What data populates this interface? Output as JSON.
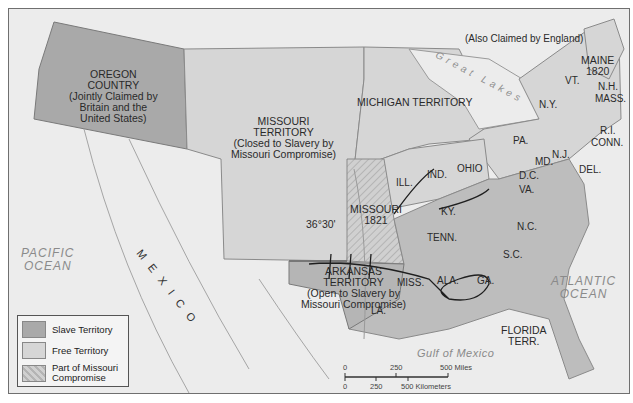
{
  "map": {
    "territories": {
      "oregon": {
        "name": "OREGON",
        "name2": "COUNTRY",
        "note1": "(Jointly Claimed by",
        "note2": "Britain and the",
        "note3": "United States)"
      },
      "missouri_territory": {
        "name": "MISSOURI",
        "name2": "TERRITORY",
        "note1": "(Closed to Slavery by",
        "note2": "Missouri Compromise)"
      },
      "michigan": {
        "name": "MICHIGAN TERRITORY"
      },
      "arkansas": {
        "name": "ARKANSAS",
        "name2": "TERRITORY",
        "note1": "(Open to Slavery by",
        "note2": "Missouri Compromise)"
      },
      "florida": {
        "name": "FLORIDA",
        "name2": "TERR."
      },
      "missouri_state": {
        "name": "MISSOURI",
        "year": "1821"
      },
      "maine": {
        "name": "MAINE",
        "year": "1820",
        "note": "(Also Claimed by England)"
      }
    },
    "states": [
      "VT.",
      "N.H.",
      "MASS.",
      "R.I.",
      "CONN.",
      "N.Y.",
      "PA.",
      "N.J.",
      "DEL.",
      "MD.",
      "D.C.",
      "VA.",
      "N.C.",
      "S.C.",
      "GA.",
      "ALA.",
      "MISS.",
      "LA.",
      "TENN.",
      "KY.",
      "OHIO",
      "IND.",
      "ILL."
    ],
    "latitude_line": "36°30'",
    "water": {
      "pacific": [
        "PACIFIC",
        "OCEAN"
      ],
      "atlantic": [
        "ATLANTIC",
        "OCEAN"
      ],
      "gulf": "Gulf of Mexico",
      "lakes": "Great Lakes"
    },
    "country": "MEXICO",
    "legend": [
      {
        "label": "Slave Territory",
        "color": "#a9a9a9"
      },
      {
        "label": "Free Territory",
        "color": "#d6d6d6"
      },
      {
        "label": "Part of Missouri",
        "label2": "Compromise",
        "color": "#c8c8c8"
      }
    ],
    "scale": {
      "miles": [
        "0",
        "250",
        "500 Miles"
      ],
      "km": [
        "0",
        "250",
        "500 Kilometers"
      ]
    },
    "colors": {
      "slave": "#a9a9a9",
      "free": "#d6d6d6",
      "background": "#ececec",
      "border": "#7a7a7a"
    }
  }
}
